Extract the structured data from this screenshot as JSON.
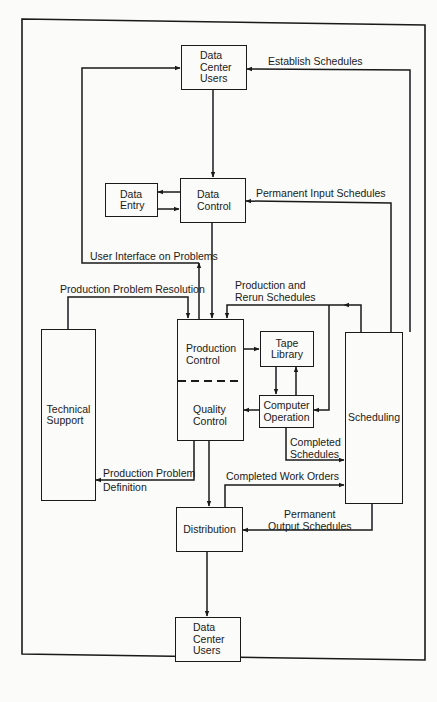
{
  "diagram": {
    "nodes": {
      "users_top": "Data\nCenter\nUsers",
      "data_entry": "Data\nEntry",
      "data_control": "Data\nControl",
      "production_control": "Production\nControl",
      "quality_control": "Quality\nControl",
      "tape_library": "Tape\nLibrary",
      "computer_operation": "Computer\nOperation",
      "technical_support": "Technical\nSupport",
      "scheduling": "Scheduling",
      "distribution": "Distribution",
      "users_bottom": "Data\nCenter\nUsers"
    },
    "edge_labels": {
      "establish_schedules": "Establish Schedules",
      "permanent_input_schedules": "Permanent Input Schedules",
      "user_interface_on_problems": "User Interface on Problems",
      "production_problem_resolution": "Production Problem Resolution",
      "production_and_rerun_schedules": "Production and\nRerun Schedules",
      "completed_schedules": "Completed\nSchedules",
      "production_problem_definition_line1": "Production Problem",
      "production_problem_definition_line2": "Definition",
      "completed_work_orders": "Completed Work Orders",
      "permanent_output_schedules": "Permanent\nOutput Schedules"
    },
    "edges": [
      {
        "from": "Data Center Users",
        "to": "Data Control"
      },
      {
        "from": "Data Control",
        "to": "Data Entry"
      },
      {
        "from": "Data Entry",
        "to": "Data Control"
      },
      {
        "from": "Data Control",
        "to": "Production Control"
      },
      {
        "from": "Scheduling",
        "to": "Data Center Users",
        "label": "Establish Schedules"
      },
      {
        "from": "Scheduling",
        "to": "Data Control",
        "label": "Permanent Input Schedules"
      },
      {
        "from": "Production Control",
        "to": "Data Center Users",
        "label": "User Interface on Problems"
      },
      {
        "from": "Technical Support",
        "to": "Production Control",
        "label": "Production Problem Resolution"
      },
      {
        "from": "Scheduling",
        "to": "Production Control",
        "label": "Production and Rerun Schedules"
      },
      {
        "from": "Scheduling",
        "to": "Computer Operation",
        "label": "Production and Rerun Schedules"
      },
      {
        "from": "Production Control",
        "to": "Tape Library"
      },
      {
        "from": "Tape Library",
        "to": "Computer Operation"
      },
      {
        "from": "Computer Operation",
        "to": "Tape Library"
      },
      {
        "from": "Computer Operation",
        "to": "Quality Control"
      },
      {
        "from": "Computer Operation",
        "to": "Scheduling",
        "label": "Completed Schedules"
      },
      {
        "from": "Quality Control",
        "to": "Technical Support",
        "label": "Production Problem Definition"
      },
      {
        "from": "Quality Control",
        "to": "Distribution"
      },
      {
        "from": "Distribution",
        "to": "Scheduling",
        "label": "Completed Work Orders"
      },
      {
        "from": "Scheduling",
        "to": "Distribution",
        "label": "Permanent Output Schedules"
      },
      {
        "from": "Distribution",
        "to": "Data Center Users"
      }
    ]
  }
}
